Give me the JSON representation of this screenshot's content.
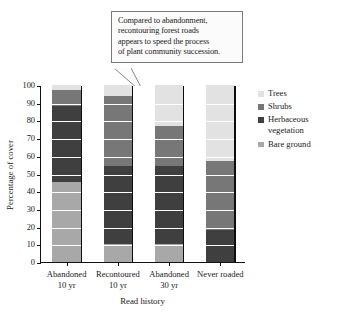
{
  "callout": {
    "lines": [
      "Compared to abandonment,",
      "recontouring forest roads",
      "appears to speed the process",
      "of plant community succession."
    ]
  },
  "legend": {
    "items": [
      {
        "label": "Trees",
        "label_cont": "",
        "color": "#e2e2e2"
      },
      {
        "label": "Shrubs",
        "label_cont": "",
        "color": "#777777"
      },
      {
        "label": "Herbaceous",
        "label_cont": "vegetation",
        "color": "#3f3f3f"
      },
      {
        "label": "Bare ground",
        "label_cont": "",
        "color": "#a8a8a8"
      }
    ]
  },
  "chart_data": {
    "type": "bar",
    "subtype": "stacked-bar-100",
    "title": "",
    "xlabel": "Read history",
    "ylabel": "Percentage of cover",
    "ylim": [
      0,
      100
    ],
    "yticks": [
      0,
      10,
      20,
      30,
      40,
      50,
      60,
      70,
      80,
      90,
      100
    ],
    "ytick_labels": [
      "0",
      "10",
      "20",
      "30",
      "40",
      "50",
      "60",
      "70",
      "80",
      "90",
      "100"
    ],
    "grid": true,
    "legend_position": "right",
    "categories": [
      "Abandoned 10 yr",
      "Recontoured 10 yr",
      "Abandoned 30 yr",
      "Never roaded"
    ],
    "category_lines": [
      {
        "l1": "Abandoned",
        "l2": "10 yr"
      },
      {
        "l1": "Recontoured",
        "l2": "10 yr"
      },
      {
        "l1": "Abandoned",
        "l2": "30 yr"
      },
      {
        "l1": "Never roaded",
        "l2": ""
      }
    ],
    "series": [
      {
        "name": "Bare ground",
        "color": "#a8a8a8",
        "values": [
          45,
          10,
          10,
          0
        ]
      },
      {
        "name": "Herbaceous vegetation",
        "color": "#3f3f3f",
        "values": [
          43,
          44,
          44,
          18
        ]
      },
      {
        "name": "Shrubs",
        "color": "#777777",
        "values": [
          9,
          40,
          23,
          39
        ]
      },
      {
        "name": "Trees",
        "color": "#e2e2e2",
        "values": [
          3,
          6,
          23,
          43
        ]
      }
    ],
    "stack_order_bottom_to_top": [
      "Bare ground",
      "Herbaceous vegetation",
      "Shrubs",
      "Trees"
    ],
    "cumulative_tops": {
      "Abandoned 10 yr": {
        "Bare ground": 45,
        "Herbaceous vegetation": 88,
        "Shrubs": 97,
        "Trees": 100
      },
      "Recontoured 10 yr": {
        "Bare ground": 10,
        "Herbaceous vegetation": 54,
        "Shrubs": 94,
        "Trees": 100
      },
      "Abandoned 30 yr": {
        "Bare ground": 10,
        "Herbaceous vegetation": 54,
        "Shrubs": 77,
        "Trees": 100
      },
      "Never roaded": {
        "Bare ground": 0,
        "Herbaceous vegetation": 18,
        "Shrubs": 57,
        "Trees": 100
      }
    }
  }
}
